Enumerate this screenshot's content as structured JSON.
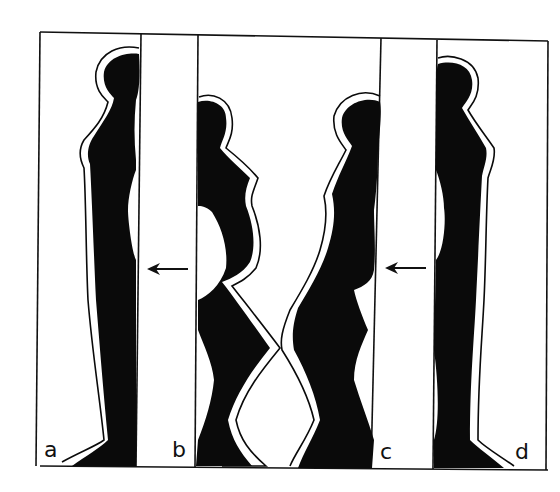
{
  "figure": {
    "panels": [
      {
        "id": "a",
        "label": "a"
      },
      {
        "id": "b",
        "label": "b"
      },
      {
        "id": "c",
        "label": "c"
      },
      {
        "id": "d",
        "label": "d"
      }
    ],
    "arrows": [
      {
        "name": "arrow-left-ab",
        "direction": "left"
      },
      {
        "name": "arrow-left-cd",
        "direction": "left"
      }
    ],
    "colors": {
      "ink": "#0a0a0a",
      "background": "#ffffff"
    }
  }
}
